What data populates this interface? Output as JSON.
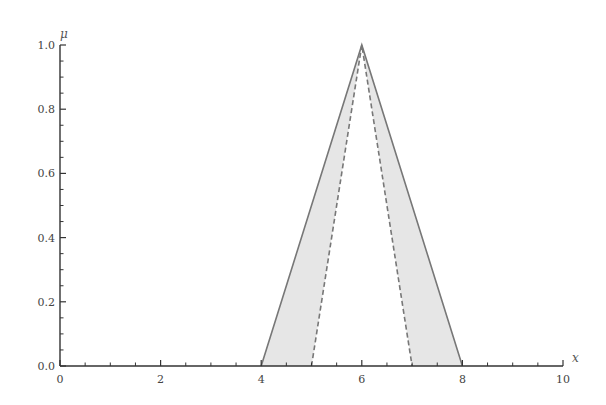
{
  "chart_data": {
    "type": "line",
    "title": "",
    "xlabel": "x",
    "ylabel": "μ",
    "xlim": [
      0,
      10
    ],
    "ylim": [
      0,
      1
    ],
    "grid": false,
    "legend": null,
    "x_ticks": [
      0,
      2,
      4,
      6,
      8,
      10
    ],
    "x_tick_labels": [
      "0",
      "2",
      "4",
      "6",
      "8",
      "10"
    ],
    "x_minor_step": 0.5,
    "y_ticks": [
      0.0,
      0.2,
      0.4,
      0.6,
      0.8,
      1.0
    ],
    "y_tick_labels": [
      "0.0",
      "0.2",
      "0.4",
      "0.6",
      "0.8",
      "1.0"
    ],
    "y_minor_step": 0.05,
    "series": [
      {
        "name": "outer triangular membership (solid)",
        "style": "solid",
        "color": "#777777",
        "x": [
          4,
          6,
          8
        ],
        "y": [
          0,
          1,
          0
        ]
      },
      {
        "name": "inner triangular membership (dashed)",
        "style": "dashed",
        "color": "#777777",
        "x": [
          5,
          6,
          7
        ],
        "y": [
          0,
          1,
          0
        ]
      }
    ],
    "shaded_region": {
      "between": [
        "outer triangular membership (solid)",
        "inner triangular membership (dashed)"
      ],
      "color": "#e6e6e6"
    }
  },
  "colors": {
    "axis": "#333333",
    "line": "#777777",
    "fill": "#e6e6e6"
  }
}
